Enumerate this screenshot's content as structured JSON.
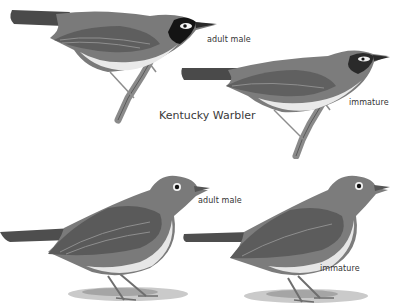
{
  "plate": {
    "title": "Kentucky Warbler",
    "colors": {
      "background": "#ffffff",
      "plumage_dark": "#3a3a3a",
      "plumage_mid": "#7a7a7a",
      "plumage_light": "#a8a8a8",
      "belly": "#e8e8e8",
      "mask": "#111111",
      "text": "#333333"
    },
    "figures": [
      {
        "id": "top-left",
        "species": "Kentucky Warbler",
        "label": "adult male",
        "pose": "perched on branch"
      },
      {
        "id": "top-right",
        "species": "Kentucky Warbler",
        "label": "immature",
        "pose": "perched on branch"
      },
      {
        "id": "bottom-left",
        "species": "unlabeled species",
        "label": "adult male",
        "pose": "standing on ground"
      },
      {
        "id": "bottom-right",
        "species": "unlabeled species",
        "label": "immature",
        "pose": "standing on ground"
      }
    ]
  }
}
